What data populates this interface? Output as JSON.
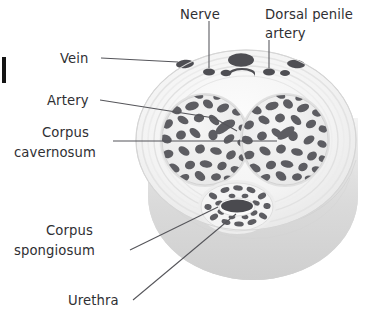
{
  "figure": {
    "type": "anatomical-cross-section",
    "background_color": "#ffffff",
    "view": "three-quarter cut cylinder showing transverse section"
  },
  "labels": [
    {
      "id": "nerve",
      "text": "Nerve",
      "anchor_x": 200,
      "anchor_y": 14,
      "align": "middle",
      "leader": "M 209 21 L 209 68",
      "points_to": "small dark dorsal nerve bundle, left of midline in upper vessel row"
    },
    {
      "id": "dorsal-penile-artery",
      "text_line_1": "Dorsal penile",
      "text_line_2": "artery",
      "anchor_x": 265,
      "anchor_y": 14,
      "anchor_y2": 33,
      "align": "start",
      "leader": "M 269 40 L 269 68",
      "points_to": "paired dorsal penile arteries flanking the deep dorsal vein"
    },
    {
      "id": "vein",
      "text": "Vein",
      "anchor_x": 60,
      "anchor_y": 62,
      "align": "start",
      "leader": "M 101 58 L 178 62",
      "points_to": "superficial dorsal vein, left lateral dark oval"
    },
    {
      "id": "artery",
      "text": "Artery",
      "anchor_x": 47,
      "anchor_y": 104,
      "align": "start",
      "leader": "M 100 100 L 215 118 L 237 131",
      "points_to": "deep (cavernosal) artery inside left corpus cavernosum"
    },
    {
      "id": "corpus-cavernosum",
      "text_line_1": "Corpus",
      "text_line_2": "cavernosum",
      "anchor_x": 42,
      "anchor_y": 134,
      "anchor_y2": 154,
      "align": "start",
      "leader": "M 113 141 L 277 141",
      "points_to": "the two large paired erectile chambers"
    },
    {
      "id": "corpus-spongiosum",
      "text_line_1": "Corpus",
      "text_line_2": "spongiosum",
      "anchor_x": 40,
      "anchor_y": 232,
      "anchor_y2": 252,
      "align": "start",
      "leader": "M 130 250 L 218 207",
      "points_to": "ring of spongy erectile tissue around the urethra"
    },
    {
      "id": "urethra",
      "text": "Urethra",
      "anchor_x": 68,
      "anchor_y": 305,
      "align": "start",
      "leader": "M 133 300 L 235 216",
      "points_to": "central dark urethral lumen"
    }
  ],
  "structures": {
    "cylinder": {
      "name": "penile shaft cylinder",
      "body_color": "#dcdcdc",
      "body_highlight": "#f2f2f2",
      "body_shadow": "#c6c6c6"
    },
    "cut_face": {
      "name": "transverse cut surface",
      "color": "#f6f6f6",
      "tunica_layer_color": "#e6e6e6"
    },
    "corpora_cavernosa": {
      "count": 2,
      "fill_color": "#efefef",
      "trabecula_color": "#5d5d62",
      "left_center": [
        205,
        140
      ],
      "right_center": [
        285,
        140
      ],
      "radius_x": 43,
      "radius_y": 45
    },
    "corpus_spongiosum": {
      "center": [
        237,
        207
      ],
      "radius_x": 36,
      "radius_y": 24,
      "spot_color": "#5d5d62"
    },
    "urethra": {
      "center": [
        237,
        207
      ],
      "radius_x": 17,
      "radius_y": 8,
      "color": "#4a4a4f"
    },
    "dorsal_vessels": [
      {
        "name": "superficial dorsal vein left",
        "cx": 185,
        "cy": 64,
        "rx": 9,
        "ry": 4.2
      },
      {
        "name": "superficial dorsal vein right",
        "cx": 296,
        "cy": 64,
        "rx": 9,
        "ry": 4.2
      },
      {
        "name": "deep dorsal vein",
        "cx": 241,
        "cy": 60,
        "rx": 13,
        "ry": 6.5
      },
      {
        "name": "dorsal nerve left",
        "cx": 209,
        "cy": 72,
        "rx": 6,
        "ry": 3.4
      },
      {
        "name": "dorsal nerve left outer",
        "cx": 226,
        "cy": 73,
        "rx": 5.5,
        "ry": 3.2
      },
      {
        "name": "dorsal penile artery left",
        "cx": 269,
        "cy": 72,
        "rx": 6,
        "ry": 3.4
      },
      {
        "name": "dorsal penile artery right",
        "cx": 285,
        "cy": 73,
        "rx": 5,
        "ry": 3
      },
      {
        "name": "midline vessel",
        "cx": 242,
        "cy": 75,
        "rx": 13,
        "ry": 4.5
      }
    ]
  },
  "artifact": {
    "name": "page-edge-artifact",
    "description": "cropped black mark at left image border"
  }
}
